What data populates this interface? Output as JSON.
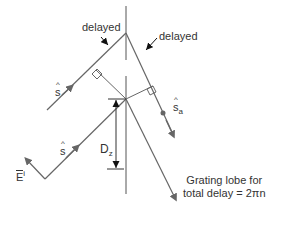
{
  "diagram": {
    "labels": {
      "delayed_left": "delayed",
      "delayed_right": "delayed",
      "s_hat_upper": "s",
      "s_hat_lower": "s",
      "s_a_base": "s",
      "s_a_sub": "a",
      "dz_base": "D",
      "dz_sub": "z",
      "e_base": "E",
      "e_sup": "i",
      "caption_line1": "Grating lobe for",
      "caption_line2": "total delay = 2πn"
    },
    "colors": {
      "line": "#555555",
      "arrow": "#666666",
      "text": "#333333"
    }
  }
}
